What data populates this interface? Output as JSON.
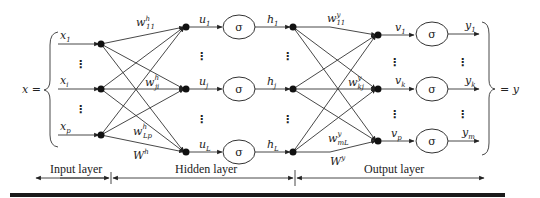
{
  "diagram": {
    "input_vector_label": "x =",
    "output_vector_label": "= y",
    "activation_symbol": "σ",
    "inputs": [
      {
        "base": "x",
        "sub": "1"
      },
      {
        "base": "x",
        "sub": "i"
      },
      {
        "base": "x",
        "sub": "p"
      }
    ],
    "hidden_sums": [
      {
        "base": "u",
        "sub": "1"
      },
      {
        "base": "u",
        "sub": "j"
      },
      {
        "base": "u",
        "sub": "L"
      }
    ],
    "hidden_outputs": [
      {
        "base": "h",
        "sub": "1"
      },
      {
        "base": "h",
        "sub": "j"
      },
      {
        "base": "h",
        "sub": "L"
      }
    ],
    "output_sums": [
      {
        "base": "v",
        "sub": "1"
      },
      {
        "base": "v",
        "sub": "k"
      },
      {
        "base": "v",
        "sub": "p"
      }
    ],
    "outputs": [
      {
        "base": "y",
        "sub": "1"
      },
      {
        "base": "y",
        "sub": "k"
      },
      {
        "base": "y",
        "sub": "m"
      }
    ],
    "hidden_weights": [
      {
        "base": "w",
        "sub": "11",
        "sup": "h"
      },
      {
        "base": "w",
        "sub": "ji",
        "sup": "h"
      },
      {
        "base": "w",
        "sub": "Lp",
        "sup": "h"
      }
    ],
    "hidden_weight_matrix": {
      "base": "W",
      "sup": "h"
    },
    "output_weights": [
      {
        "base": "w",
        "sub": "11",
        "sup": "y"
      },
      {
        "base": "w",
        "sub": "kj",
        "sup": "y"
      },
      {
        "base": "w",
        "sub": "mL",
        "sup": "y"
      }
    ],
    "output_weight_matrix": {
      "base": "W",
      "sup": "y"
    },
    "ellipsis": "⋮",
    "layers": {
      "input": "Input layer",
      "hidden": "Hidden layer",
      "output": "Output layer"
    }
  }
}
